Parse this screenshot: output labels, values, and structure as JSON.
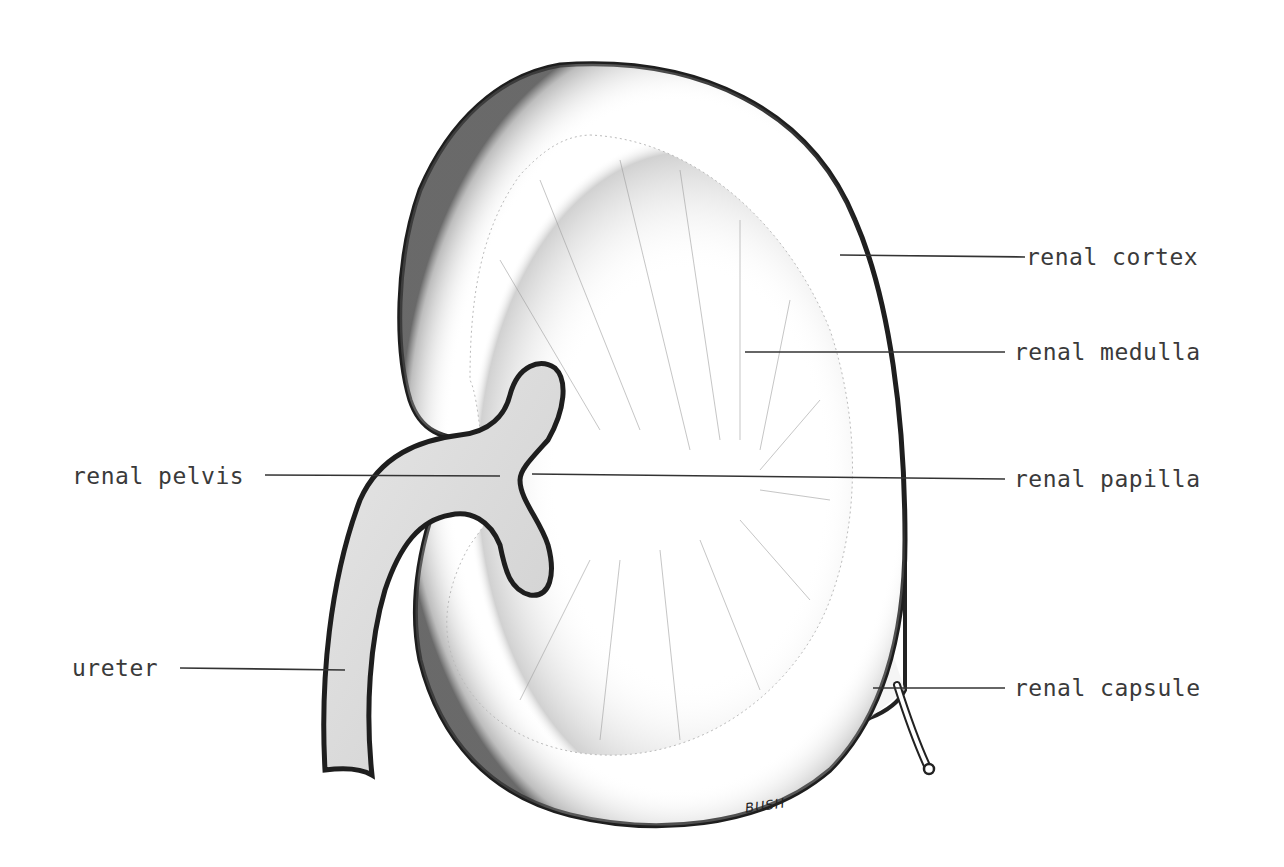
{
  "diagram": {
    "colors": {
      "outline": "#222222",
      "pelvis_fill": "#dcdcdc",
      "hatch": "#555555",
      "label_text": "#3a3a3a",
      "leader_line": "#333333",
      "background": "#ffffff"
    },
    "labels": {
      "renal_cortex": "renal cortex",
      "renal_medulla": "renal medulla",
      "renal_pelvis": "renal pelvis",
      "renal_papilla": "renal papilla",
      "ureter": "ureter",
      "renal_capsule": "renal capsule"
    },
    "signature": "BUSH"
  }
}
